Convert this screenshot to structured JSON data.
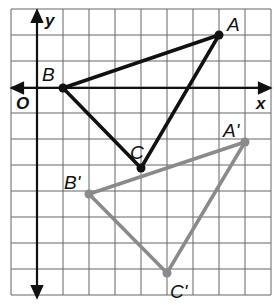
{
  "diagram": {
    "axes": {
      "x_label": "x",
      "y_label": "y",
      "origin_label": "O"
    },
    "grid": {
      "origin_px": [
        37,
        88
      ],
      "cell_px": 26,
      "cols": 10,
      "rows": 11,
      "left_px": 11,
      "top_px": 9
    },
    "colors": {
      "original": "#111111",
      "image": "#8a8a8a",
      "grid": "#555555"
    },
    "triangles": [
      {
        "name": "ABC",
        "points": [
          {
            "label": "A",
            "x": 7,
            "y": 2
          },
          {
            "label": "B",
            "x": 1,
            "y": 0
          },
          {
            "label": "C",
            "x": 4,
            "y": -3
          }
        ]
      },
      {
        "name": "A'B'C'",
        "points": [
          {
            "label": "A'",
            "x": 8,
            "y": -2
          },
          {
            "label": "B'",
            "x": 2,
            "y": -4
          },
          {
            "label": "C'",
            "x": 5,
            "y": -7
          }
        ]
      }
    ]
  }
}
